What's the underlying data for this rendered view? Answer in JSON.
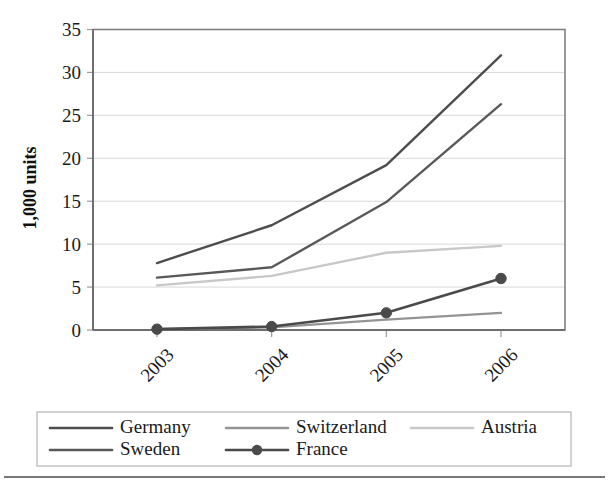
{
  "chart_data": {
    "type": "line",
    "title": "",
    "xlabel": "",
    "ylabel": "1,000 units",
    "categories": [
      "2003",
      "2004",
      "2005",
      "2006"
    ],
    "ylim": [
      0,
      35
    ],
    "ytick_values": [
      0,
      5,
      10,
      15,
      20,
      25,
      30,
      35
    ],
    "ytick_labels": [
      "0",
      "5",
      "10",
      "15",
      "20",
      "25",
      "30",
      "35"
    ],
    "grid": "horizontal",
    "legend_position": "bottom",
    "xtick_rotation": -45,
    "series": [
      {
        "name": "Germany",
        "values": [
          7.8,
          12.2,
          19.2,
          32.0
        ],
        "color": "#4d4d4d",
        "width": 2.4,
        "marker": "none"
      },
      {
        "name": "Sweden",
        "values": [
          6.1,
          7.3,
          14.9,
          26.3
        ],
        "color": "#595959",
        "width": 2.4,
        "marker": "none"
      },
      {
        "name": "Austria",
        "values": [
          5.2,
          6.3,
          9.0,
          9.8
        ],
        "color": "#c8c8c8",
        "width": 2.4,
        "marker": "none"
      },
      {
        "name": "Switzerland",
        "values": [
          0.1,
          0.3,
          1.2,
          2.0
        ],
        "color": "#949494",
        "width": 2.2,
        "marker": "none"
      },
      {
        "name": "France",
        "values": [
          0.1,
          0.4,
          2.0,
          6.0
        ],
        "color": "#4a4a4a",
        "width": 2.6,
        "marker": "circle"
      }
    ]
  },
  "legend": {
    "entries": [
      {
        "label": "Germany",
        "color": "#4d4d4d",
        "marker": "none",
        "row": 0,
        "col": 0
      },
      {
        "label": "Switzerland",
        "color": "#949494",
        "marker": "none",
        "row": 0,
        "col": 1
      },
      {
        "label": "Austria",
        "color": "#c8c8c8",
        "marker": "none",
        "row": 0,
        "col": 2
      },
      {
        "label": "Sweden",
        "color": "#595959",
        "marker": "none",
        "row": 1,
        "col": 0
      },
      {
        "label": "France",
        "color": "#4a4a4a",
        "marker": "circle",
        "row": 1,
        "col": 1
      }
    ]
  },
  "colors": {
    "grid": "#d9d9d9",
    "axis": "#6e6e6e",
    "plot_border": "#808080",
    "text": "#1a1a1a",
    "legend_border": "#b4b4b4",
    "page_rule": "#4a4a4a"
  }
}
